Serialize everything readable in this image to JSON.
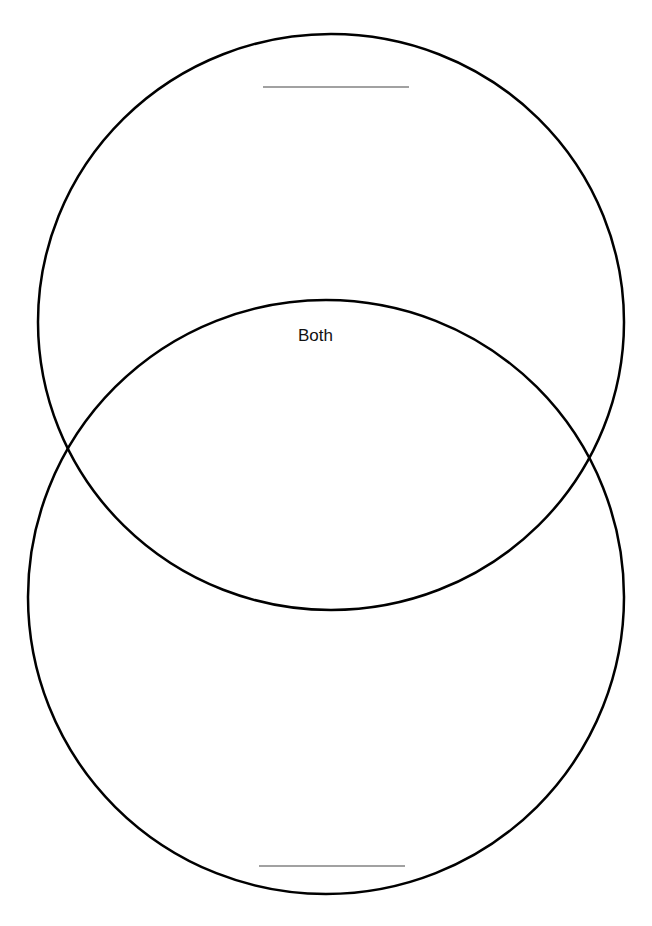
{
  "diagram": {
    "type": "venn",
    "orientation": "vertical",
    "circles": [
      {
        "id": "top",
        "cx": 331,
        "cy": 322,
        "rx": 293,
        "ry": 288,
        "title_line": {
          "x1": 263,
          "x2": 409,
          "y": 87
        }
      },
      {
        "id": "bottom",
        "cx": 326,
        "cy": 597,
        "rx": 298,
        "ry": 297,
        "title_line": {
          "x1": 259,
          "x2": 405,
          "y": 866
        }
      }
    ],
    "overlap_label": "Both",
    "stroke_color": "#000000",
    "line_color": "#444444"
  }
}
